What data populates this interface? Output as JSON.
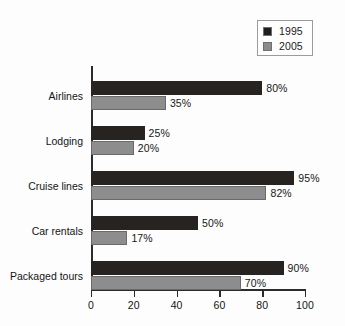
{
  "chart_data": {
    "type": "bar",
    "orientation": "horizontal",
    "title": "",
    "xlabel": "",
    "ylabel": "",
    "xlim": [
      0,
      100
    ],
    "xticks": [
      0,
      20,
      40,
      60,
      80,
      100
    ],
    "grid": false,
    "legend_position": "top-right",
    "categories": [
      "Airlines",
      "Lodging",
      "Cruise lines",
      "Car rentals",
      "Packaged tours"
    ],
    "series": [
      {
        "name": "1995",
        "color": "#262320",
        "values": [
          80,
          25,
          95,
          50,
          90
        ],
        "labels": [
          "80%",
          "25%",
          "95%",
          "50%",
          "90%"
        ]
      },
      {
        "name": "2005",
        "color": "#8d8d8d",
        "values": [
          35,
          20,
          82,
          17,
          70
        ],
        "labels": [
          "35%",
          "20%",
          "82%",
          "17%",
          "70%"
        ]
      }
    ]
  },
  "legend": {
    "items": [
      {
        "label": "1995",
        "swatch": "dark-swatch-icon"
      },
      {
        "label": "2005",
        "swatch": "gray-swatch-icon"
      }
    ]
  },
  "axis": {
    "x_tick_labels": [
      "0",
      "20",
      "40",
      "60",
      "80",
      "100"
    ]
  },
  "categories": {
    "items": [
      "Airlines",
      "Lodging",
      "Cruise lines",
      "Car rentals",
      "Packaged tours"
    ]
  },
  "colors": {
    "series_1995": "#262320",
    "series_2005": "#8d8d8d",
    "axis": "#2b2b2b",
    "text": "#141414",
    "background": "#fdfdfd",
    "legend_border": "#9b9b9b"
  }
}
